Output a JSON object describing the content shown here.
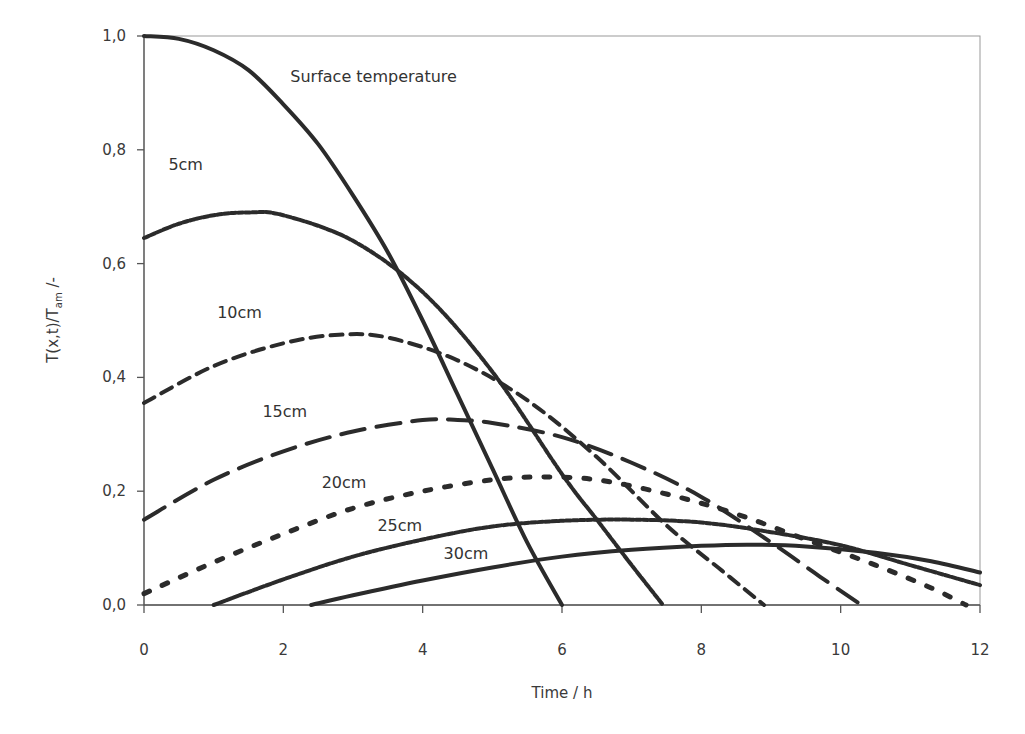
{
  "chart_data": {
    "type": "line",
    "title": "",
    "xlabel": "Time / h",
    "ylabel": "T(x,t)/T_am /-",
    "ylabel_parts": {
      "main": "T(x,t)/T",
      "sub": "am",
      "suffix": " /-"
    },
    "xlim": [
      0,
      12
    ],
    "ylim": [
      0,
      1.0
    ],
    "x_ticks": [
      0,
      2,
      4,
      6,
      8,
      10,
      12
    ],
    "x_tick_labels": [
      "0",
      "2",
      "4",
      "6",
      "8",
      "10",
      "12"
    ],
    "y_ticks": [
      0,
      0.2,
      0.4,
      0.6,
      0.8,
      1.0
    ],
    "y_tick_labels": [
      "0,0",
      "0,2",
      "0,4",
      "0,6",
      "0,8",
      "1,0"
    ],
    "grid": false,
    "legend": "inline labels",
    "series": [
      {
        "name": "Surface temperature",
        "label": "Surface temperature",
        "style": "solid",
        "width": 4,
        "x": [
          0,
          0.5,
          1,
          1.5,
          2,
          2.5,
          3,
          3.5,
          4,
          4.5,
          5,
          5.5,
          6
        ],
        "values": [
          1.0,
          0.995,
          0.975,
          0.94,
          0.88,
          0.81,
          0.72,
          0.62,
          0.5,
          0.37,
          0.24,
          0.11,
          0.0
        ]
      },
      {
        "name": "5cm",
        "label": "5cm",
        "style": "dotted-dense",
        "width": 4,
        "x": [
          0,
          0.5,
          1,
          1.5,
          2,
          3,
          4,
          5,
          6,
          6.5,
          7,
          7.45
        ],
        "values": [
          0.645,
          0.67,
          0.685,
          0.69,
          0.685,
          0.64,
          0.55,
          0.41,
          0.23,
          0.15,
          0.07,
          0.0
        ]
      },
      {
        "name": "10cm",
        "label": "10cm",
        "style": "dashed-short",
        "width": 4,
        "x": [
          0,
          1,
          2,
          2.8,
          3.5,
          4.5,
          5.5,
          6.5,
          7.5,
          8.3,
          8.9
        ],
        "values": [
          0.355,
          0.42,
          0.46,
          0.475,
          0.47,
          0.43,
          0.36,
          0.26,
          0.14,
          0.06,
          0.0
        ]
      },
      {
        "name": "15cm",
        "label": "15cm",
        "style": "dashed-long",
        "width": 4,
        "x": [
          0,
          1,
          2,
          3,
          4,
          4.5,
          5,
          6,
          7,
          8,
          9,
          9.7,
          10.3
        ],
        "values": [
          0.15,
          0.22,
          0.27,
          0.305,
          0.325,
          0.325,
          0.32,
          0.295,
          0.25,
          0.19,
          0.11,
          0.05,
          0.0
        ]
      },
      {
        "name": "20cm",
        "label": "20cm",
        "style": "dotted-sparse",
        "width": 5,
        "x": [
          0,
          1,
          2,
          3,
          4,
          5,
          5.7,
          6.5,
          7.5,
          8.5,
          9.5,
          10.5,
          11.3,
          11.8
        ],
        "values": [
          0.02,
          0.075,
          0.125,
          0.17,
          0.2,
          0.22,
          0.225,
          0.22,
          0.195,
          0.16,
          0.115,
          0.07,
          0.03,
          0.0
        ]
      },
      {
        "name": "25cm",
        "label": "25cm",
        "style": "dotted-dense",
        "width": 4,
        "x": [
          1,
          2,
          3,
          4,
          5,
          6,
          7,
          8,
          9,
          10,
          11,
          12
        ],
        "values": [
          0.0,
          0.045,
          0.085,
          0.115,
          0.138,
          0.148,
          0.15,
          0.145,
          0.128,
          0.105,
          0.07,
          0.035
        ]
      },
      {
        "name": "30cm",
        "label": "30cm",
        "style": "solid",
        "width": 4,
        "x": [
          2.4,
          3,
          4,
          5,
          6,
          7,
          8,
          8.7,
          9.5,
          10.5,
          11.3,
          12
        ],
        "values": [
          0.0,
          0.017,
          0.043,
          0.066,
          0.085,
          0.097,
          0.104,
          0.106,
          0.103,
          0.092,
          0.077,
          0.057
        ]
      }
    ],
    "annotations": [
      {
        "text": "Surface temperature",
        "x": 2.1,
        "y": 0.92
      },
      {
        "text": "5cm",
        "x": 0.35,
        "y": 0.765
      },
      {
        "text": "10cm",
        "x": 1.05,
        "y": 0.505
      },
      {
        "text": "15cm",
        "x": 1.7,
        "y": 0.33
      },
      {
        "text": "20cm",
        "x": 2.55,
        "y": 0.205
      },
      {
        "text": "25cm",
        "x": 3.35,
        "y": 0.13
      },
      {
        "text": "30cm",
        "x": 4.3,
        "y": 0.08
      }
    ]
  },
  "colors": {
    "line": "#2b2b2b",
    "axis": "#555555",
    "text": "#3a3a3a"
  }
}
